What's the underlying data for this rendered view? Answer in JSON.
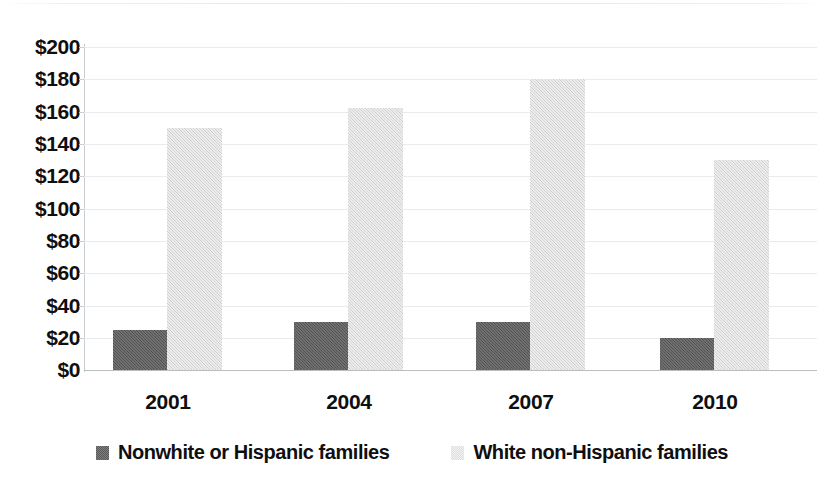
{
  "chart_data": {
    "type": "bar",
    "title": "",
    "subtitle": "",
    "xlabel": "",
    "ylabel": "",
    "categories": [
      "2001",
      "2004",
      "2007",
      "2010"
    ],
    "series": [
      {
        "name": "Nonwhite or Hispanic families",
        "color": "#5a5a5a",
        "values": [
          25,
          30,
          30,
          20
        ]
      },
      {
        "name": "White non-Hispanic families",
        "color": "#dcdcdc",
        "values": [
          150,
          162,
          180,
          130
        ]
      }
    ],
    "ylim": [
      0,
      200
    ],
    "ytick_step": 20,
    "ytick_labels": [
      "$200",
      "$180",
      "$160",
      "$140",
      "$120",
      "$100",
      "$80",
      "$60",
      "$40",
      "$20",
      "$0"
    ],
    "ytick_values": [
      200,
      180,
      160,
      140,
      120,
      100,
      80,
      60,
      40,
      20,
      0
    ],
    "grid": true,
    "grid_axis": "y",
    "legend_position": "bottom",
    "value_prefix": "$"
  },
  "legend": {
    "items": [
      {
        "label": "Nonwhite or Hispanic families",
        "swatch": "dark"
      },
      {
        "label": "White non-Hispanic families",
        "swatch": "light"
      }
    ]
  }
}
